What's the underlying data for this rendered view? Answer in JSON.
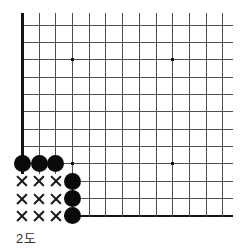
{
  "caption": "2도",
  "colors": {
    "background": "#ffffff",
    "grid_line": "#4f4f4f",
    "board_edge": "#141414",
    "stone": "#0a0a0a",
    "mark": "#1a1a1a",
    "caption_text": "#333333"
  },
  "board": {
    "cols": 13,
    "rows": 12,
    "origin_x": 22.4,
    "origin_y": 25,
    "cell_w": 16.7,
    "cell_h": 17.35,
    "top_overhang": 12,
    "right_overhang": 10,
    "line_thickness": 1,
    "edge_thickness": 2.6,
    "edge_left_col": 0,
    "edge_bottom_row": 11,
    "star_size": 3.4,
    "stone_diameter": 17.2,
    "mark_size": 10.5,
    "star_points": [
      [
        3,
        2
      ],
      [
        9,
        2
      ],
      [
        3,
        8
      ],
      [
        9,
        8
      ]
    ],
    "black_stones": [
      [
        0,
        8
      ],
      [
        1,
        8
      ],
      [
        2,
        8
      ],
      [
        3,
        9
      ],
      [
        3,
        10
      ],
      [
        3,
        11
      ]
    ],
    "territory_marks": [
      [
        0,
        9
      ],
      [
        1,
        9
      ],
      [
        2,
        9
      ],
      [
        0,
        10
      ],
      [
        1,
        10
      ],
      [
        2,
        10
      ],
      [
        0,
        11
      ],
      [
        1,
        11
      ],
      [
        2,
        11
      ]
    ]
  }
}
